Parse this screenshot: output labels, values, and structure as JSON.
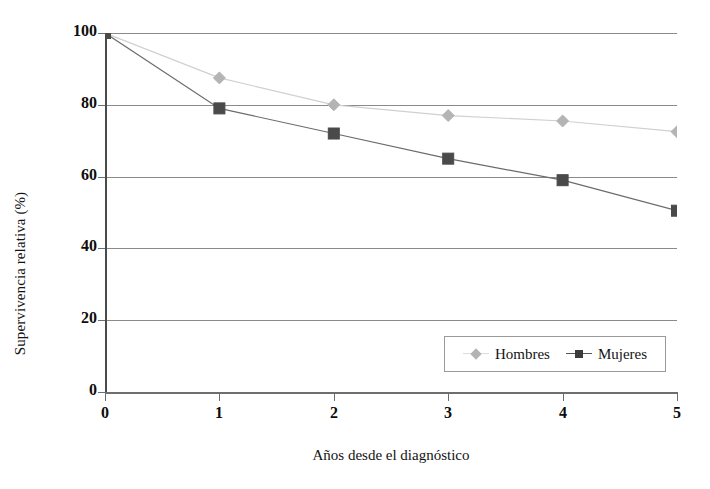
{
  "chart_data": {
    "type": "line",
    "title": "",
    "xlabel": "Años desde el diagnóstico",
    "ylabel": "Supervivencia relativa (%)",
    "x": [
      0,
      1,
      2,
      3,
      4,
      5
    ],
    "xtick_labels": [
      "0",
      "1",
      "2",
      "3",
      "4",
      "5"
    ],
    "ytick_labels": [
      "0",
      "20",
      "40",
      "60",
      "80",
      "100"
    ],
    "yticks": [
      0,
      20,
      40,
      60,
      80,
      100
    ],
    "xlim": [
      0,
      5
    ],
    "ylim": [
      0,
      100
    ],
    "grid": "horizontal",
    "legend_position": "bottom-right-inside",
    "series": [
      {
        "name": "Hombres",
        "marker": "diamond",
        "color": "#b4b4b4",
        "line_color": "#d0d0d0",
        "values": [
          100,
          87.5,
          80,
          77,
          75.5,
          72.5
        ]
      },
      {
        "name": "Mujeres",
        "marker": "square",
        "color": "#4a4a4a",
        "line_color": "#6b6b6b",
        "values": [
          100,
          79,
          72,
          65,
          59,
          50.5
        ]
      }
    ]
  },
  "axis": {
    "y_title": "Supervivencia relativa (%)",
    "x_title": "Años desde el diagnóstico"
  },
  "legend": {
    "items": [
      {
        "label": "Hombres"
      },
      {
        "label": "Mujeres"
      }
    ]
  },
  "colors": {
    "grid": "#8a8a8a",
    "axis": "#6e6e6e",
    "text": "#131313",
    "hombres": "#b4b4b4",
    "mujeres": "#4a4a4a",
    "background": "#ffffff"
  }
}
